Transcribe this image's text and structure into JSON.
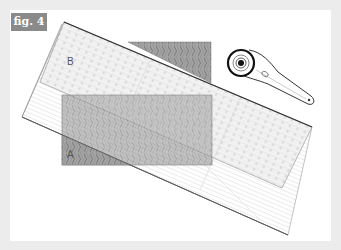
{
  "figure": {
    "label": "fig. 4",
    "labels": {
      "ruler": "B",
      "fabric": "A"
    },
    "elements": [
      "quilting-ruler",
      "fabric-piece-a",
      "fabric-offcut",
      "rotary-cutter"
    ]
  },
  "colors": {
    "border": "#ececec",
    "panel": "#ffffff",
    "label_bg": "#8a8a8a",
    "fabric": "#9a9a9a",
    "outline": "#333333"
  }
}
